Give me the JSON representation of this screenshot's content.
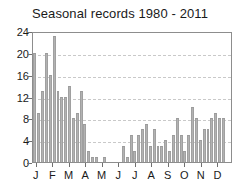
{
  "chart_data": {
    "type": "bar",
    "title": "Seasonal records 1980 - 2011",
    "xlabel": "",
    "ylabel": "",
    "ylim": [
      0,
      24
    ],
    "yticks": [
      0,
      4,
      8,
      12,
      16,
      20,
      24
    ],
    "grid": true,
    "legend": null,
    "categories": [
      "W1",
      "W2",
      "W3",
      "W4",
      "W5",
      "W6",
      "W7",
      "W8",
      "W9",
      "W10",
      "W11",
      "W12",
      "W13",
      "W14",
      "W15",
      "W16",
      "W17",
      "W18",
      "W19",
      "W20",
      "W21",
      "W22",
      "W23",
      "W24",
      "W25",
      "W26",
      "W27",
      "W28",
      "W29",
      "W30",
      "W31",
      "W32",
      "W33",
      "W34",
      "W35",
      "W36",
      "W37",
      "W38",
      "W39",
      "W40",
      "W41",
      "W42",
      "W43",
      "W44",
      "W45",
      "W46",
      "W47",
      "W48",
      "W49",
      "W50",
      "W51",
      "W52"
    ],
    "values": [
      20,
      9,
      13,
      20,
      16,
      23,
      13,
      12,
      12,
      14,
      8,
      9,
      13,
      7,
      2,
      1,
      1,
      0,
      1,
      0,
      0,
      0,
      0,
      3,
      1,
      5,
      2,
      5,
      6,
      7,
      3,
      6,
      3,
      3,
      4,
      2,
      5,
      8,
      5,
      2,
      5,
      10,
      8,
      4,
      6,
      6,
      8,
      9,
      8,
      8,
      0,
      0
    ],
    "month_ticks": [
      {
        "label": "J",
        "pos": 0.5
      },
      {
        "label": "F",
        "pos": 4.8
      },
      {
        "label": "M",
        "pos": 9.0
      },
      {
        "label": "A",
        "pos": 13.3
      },
      {
        "label": "M",
        "pos": 17.6
      },
      {
        "label": "J",
        "pos": 21.9
      },
      {
        "label": "J",
        "pos": 26.2
      },
      {
        "label": "A",
        "pos": 30.5
      },
      {
        "label": "S",
        "pos": 34.8
      },
      {
        "label": "O",
        "pos": 39.1
      },
      {
        "label": "N",
        "pos": 43.4
      },
      {
        "label": "D",
        "pos": 47.7
      }
    ],
    "colors": {
      "bar_fill": "#b2b2b2",
      "bar_edge": "#9b9b9b",
      "grid": "#c9c9c9",
      "axis": "#8d8d8d",
      "text": "#1a1a1a",
      "background": "#ffffff"
    }
  }
}
